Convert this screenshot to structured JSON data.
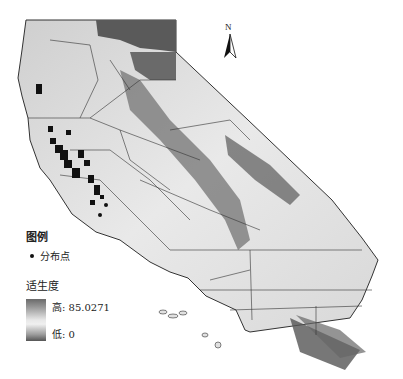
{
  "map": {
    "region": "California",
    "north_arrow": {
      "label": "N"
    }
  },
  "legend": {
    "title": "图例",
    "items": [
      {
        "symbol": "dot",
        "label": "分布点",
        "color": "#111111"
      }
    ],
    "ramp": {
      "title": "适生度",
      "high_label": "高: 85.0271",
      "low_label": "低: 0",
      "high_value": 85.0271,
      "low_value": 0
    }
  },
  "colors": {
    "high": "#5a5a5a",
    "mid": "#e8e8e8",
    "low": "#4a4a4a",
    "boundary": "#333333",
    "points": "#111111"
  }
}
